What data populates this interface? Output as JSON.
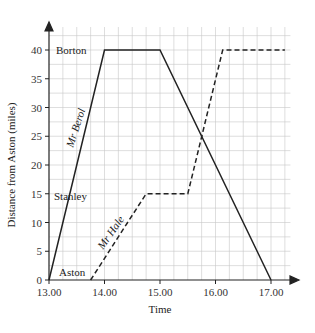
{
  "chart_data": {
    "type": "line",
    "title": "",
    "xlabel": "Time",
    "ylabel": "Distance from Aston (miles)",
    "x_ticks": [
      "13.00",
      "14.00",
      "15.00",
      "16.00",
      "17.00"
    ],
    "y_ticks": [
      "0",
      "5",
      "10",
      "15",
      "20",
      "25",
      "30",
      "35",
      "40"
    ],
    "xlim": [
      13.0,
      17.3
    ],
    "ylim": [
      0,
      44
    ],
    "grid": true,
    "grid_minor_x": "15 minutes",
    "grid_minor_y": "2.5 miles",
    "place_labels": [
      {
        "text": "Borton",
        "y": 40
      },
      {
        "text": "Stanley",
        "y": 15
      },
      {
        "text": "Aston",
        "y": 0
      }
    ],
    "series": [
      {
        "name": "Mr Berol",
        "style": "solid",
        "points": [
          {
            "time": "13.00",
            "x": 13.0,
            "y": 0
          },
          {
            "time": "14.00",
            "x": 14.0,
            "y": 40
          },
          {
            "time": "15.00",
            "x": 15.0,
            "y": 40
          },
          {
            "time": "17.00",
            "x": 17.0,
            "y": 0
          }
        ]
      },
      {
        "name": "Mr Hale",
        "style": "dashed",
        "points": [
          {
            "time": "13.45",
            "x": 13.75,
            "y": 0
          },
          {
            "time": "14.45",
            "x": 14.75,
            "y": 15
          },
          {
            "time": "15.30",
            "x": 15.5,
            "y": 15
          },
          {
            "time": "16.08",
            "x": 16.13,
            "y": 40
          },
          {
            "time": "17.15",
            "x": 17.25,
            "y": 40
          }
        ]
      }
    ]
  },
  "labels": {
    "xlabel": "Time",
    "ylabel": "Distance from Aston (miles)",
    "x_ticks": [
      "13.00",
      "14.00",
      "15.00",
      "16.00",
      "17.00"
    ],
    "y_ticks": [
      "0",
      "5",
      "10",
      "15",
      "20",
      "25",
      "30",
      "35",
      "40"
    ],
    "borton": "Borton",
    "stanley": "Stanley",
    "aston": "Aston",
    "berol": "Mr Berol",
    "hale": "Mr Hale"
  }
}
